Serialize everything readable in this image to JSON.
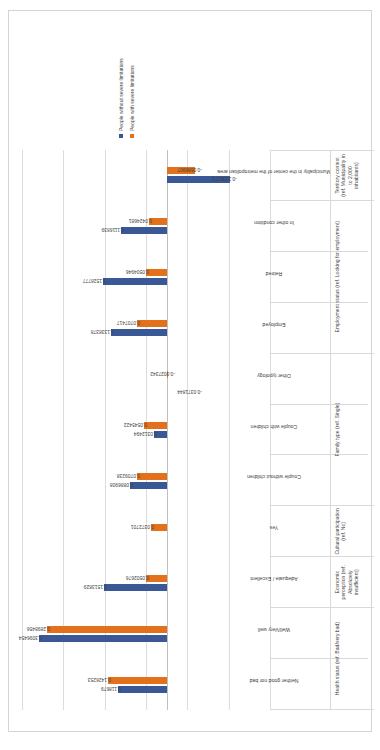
{
  "chart_data": {
    "type": "bar",
    "title": "",
    "xlabel": "",
    "ylabel": "",
    "ylim": [
      -0.25,
      0.35
    ],
    "yticks": [
      0.35,
      0.25,
      0.15,
      0.05,
      -0.05,
      -0.15,
      -0.25
    ],
    "ytick_labels": [
      "0.35",
      "0.25",
      "0.15",
      "0.05",
      "-0.05",
      "-0.15",
      "-0.25"
    ],
    "grid": true,
    "legend_position": "right",
    "orientation": "vertical-bars-rotated-page",
    "categories": [
      "Neither good nor bad",
      "Well/Very well",
      "Adequate / Excellent",
      "Yes",
      "Couple without children",
      "Couple with children",
      "Other typology",
      "Employed",
      "Retired",
      "In other condition",
      "Municipality in the center of the metropolitan area"
    ],
    "groups": [
      {
        "label": "Health status (ref. Bad/very bad)",
        "span": 2
      },
      {
        "label": "Economic perception (ref. Absolutely insufficient)",
        "span": 1
      },
      {
        "label": "Cultural participation (ref. No)",
        "span": 1
      },
      {
        "label": "Family type (ref. Single)",
        "span": 3
      },
      {
        "label": "Employment status (ref. Looking for employment)",
        "span": 3
      },
      {
        "label": "Territory context (ref. Municipality in to 2,000 inhabitants)",
        "span": 1
      }
    ],
    "series": [
      {
        "name": "People without severe limitations",
        "color": "#3a5895",
        "values": [
          0.118679,
          0.3096454,
          0.1513829,
          null,
          0.0886908,
          0.0312494,
          null,
          0.1338378,
          0.1528777,
          0.1116839,
          -0.1536173
        ],
        "labels": [
          "0.118679",
          "0.3096454",
          "0.1513829",
          "",
          "0.0886908",
          "0.0312494",
          "",
          "0.1338378",
          "0.1528777",
          "0.1116839",
          "-0.1536173"
        ]
      },
      {
        "name": "People with severe limitations",
        "color": "#e3711c",
        "values": [
          0.1426253,
          0.2898456,
          0.0502676,
          0.0372701,
          0.0709238,
          0.0545422,
          -0.0027342,
          0.0707417,
          0.0504946,
          0.0424681,
          -0.0686907
        ],
        "labels": [
          "0.1426253",
          "0.2898456",
          "0.0502676",
          "0.0372701",
          "0.0709238",
          "0.0545422",
          "-0.0027342",
          "0.0707417",
          "0.0504946",
          "0.0424681",
          "-0.0686907"
        ]
      }
    ],
    "extra_labels": [
      "-0.0371844"
    ]
  },
  "legend": {
    "items": [
      {
        "label": "People without severe limitations",
        "color": "#3a5895"
      },
      {
        "label": "People with severe limitations",
        "color": "#e3711c"
      }
    ]
  }
}
